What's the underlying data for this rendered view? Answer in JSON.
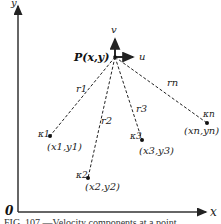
{
  "diagram": {
    "axes": {
      "origin_label": "0",
      "x_label": "x",
      "y_label": "y"
    },
    "point_p": {
      "label": "P(x,y)",
      "velocity_u_label": "u",
      "velocity_v_label": "v"
    },
    "sources": [
      {
        "strength": "κ1",
        "coords": "(x1,y1)",
        "distance": "r1"
      },
      {
        "strength": "κ2",
        "coords": "(x2,y2)",
        "distance": "r2"
      },
      {
        "strength": "κ3",
        "coords": "(x3,y3)",
        "distance": "r3"
      },
      {
        "strength": "κn",
        "coords": "(xn,yn)",
        "distance": "rn"
      }
    ],
    "caption": "FIG. 107.—Velocity components at a point"
  },
  "colors": {
    "ink": "#222222",
    "background": "#ffffff"
  }
}
